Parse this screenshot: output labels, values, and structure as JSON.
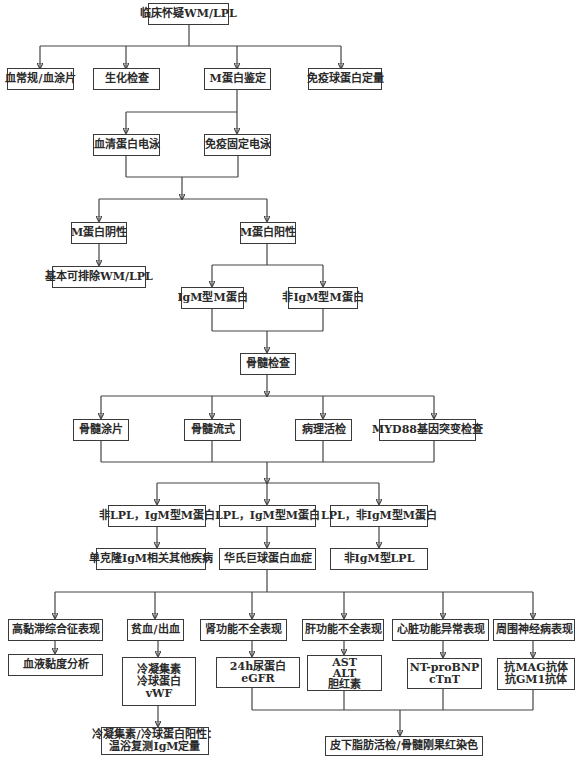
{
  "diagram": {
    "title": "临床怀疑WM/LPL",
    "initial_tests": [
      "血常规/血涂片",
      "生化检查",
      "M蛋白鉴定",
      "免疫球蛋白定量"
    ],
    "m_protein_tests": [
      "血清蛋白电泳",
      "免疫固定电泳"
    ],
    "m_protein_results": {
      "negative": "M蛋白阴性",
      "negative_conclusion": "基本可排除WM/LPL",
      "positive": "M蛋白阳性",
      "positive_types": [
        "IgM型M蛋白",
        "非IgM型M蛋白"
      ]
    },
    "bone_marrow": {
      "title": "骨髓检查",
      "tests": [
        "骨髓涂片",
        "骨髓流式",
        "病理活检",
        "MYD88基因突变检查"
      ]
    },
    "classification": {
      "categories": [
        "非LPL，IgM型M蛋白",
        "LPL，IgM型M蛋白",
        "LPL，非IgM型M蛋白"
      ],
      "diagnoses": [
        "单克隆IgM相关其他疾病",
        "华氏巨球蛋白血症",
        "非IgM型LPL"
      ]
    },
    "manifestations": [
      {
        "label": "高黏滞综合征表现",
        "tests": [
          "血液黏度分析"
        ]
      },
      {
        "label": "贫血/出血",
        "tests": [
          "冷凝集素",
          "冷球蛋白",
          "vWF"
        ],
        "followup": [
          "冷凝集素/冷球蛋白阳性：",
          "温浴复测IgM定量"
        ]
      },
      {
        "label": "肾功能不全表现",
        "tests": [
          "24h尿蛋白",
          "eGFR"
        ]
      },
      {
        "label": "肝功能不全表现",
        "tests": [
          "AST",
          "ALT",
          "胆红素"
        ]
      },
      {
        "label": "心脏功能异常表现",
        "tests": [
          "NT-proBNP",
          "cTnT"
        ]
      },
      {
        "label": "周围神经病表现",
        "tests": [
          "抗MAG抗体",
          "抗GM1抗体"
        ]
      }
    ],
    "final_test": "皮下脂肪活检/骨髓刚果红染色"
  }
}
